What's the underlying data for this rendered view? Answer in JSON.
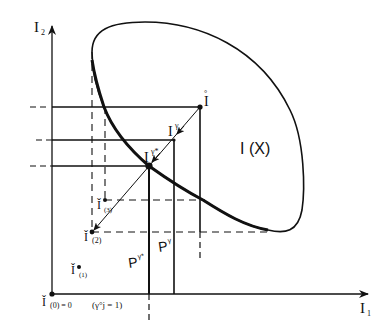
{
  "diagram": {
    "axes": {
      "y_label": "I",
      "y_label_sub": "2",
      "x_label": "I",
      "x_label_sub": "1"
    },
    "region_label": "I (X)",
    "points": {
      "I_hat": {
        "label": "I",
        "accent": "°"
      },
      "I_gamma": {
        "label": "I",
        "sup": "γ"
      },
      "I_gamma_star": {
        "label": "I",
        "sup": "γ*"
      },
      "I_check_3": {
        "label": "Ǐ",
        "sub": "(3)"
      },
      "I_check_2": {
        "label": "Ǐ",
        "sub": "(2)"
      },
      "I_check_1": {
        "label": "Ǐ",
        "sub": "(1)"
      },
      "I_check_0": {
        "label": "Ǐ",
        "sub": "(0) = 0"
      }
    },
    "origin_note": "(γ°j = 1)",
    "lines": {
      "P_gamma_star": {
        "label": "P",
        "sup": "γ*"
      },
      "P_gamma": {
        "label": "P",
        "sup": "γ"
      }
    },
    "colors": {
      "ink": "#111111",
      "background": "#ffffff"
    }
  }
}
